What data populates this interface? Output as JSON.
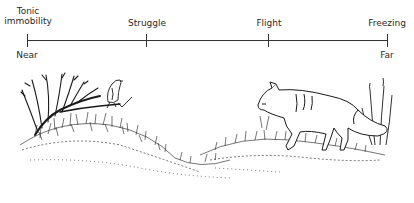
{
  "diagram": {
    "axis": {
      "start_label": "Near",
      "end_label": "Far",
      "ticks": [
        {
          "label_line1": "Tonic",
          "label_line2": "immobility"
        },
        {
          "label": "Struggle"
        },
        {
          "label": "Flight"
        },
        {
          "label": "Freezing"
        }
      ]
    },
    "illustration": {
      "left_subject": "bird perched on shrub branch",
      "right_subject": "fox walking through grass",
      "ink_color": "#1a1a1a"
    }
  }
}
